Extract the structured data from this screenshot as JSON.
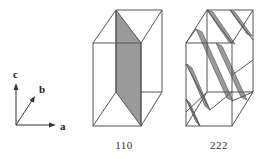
{
  "axes": {
    "a_label": "a",
    "b_label": "b",
    "c_label": "c"
  },
  "panels": [
    {
      "caption": "110",
      "description": "Unit cell with (110) plane shaded"
    },
    {
      "caption": "222",
      "description": "Unit cell with (222) planes shaded"
    }
  ],
  "colors": {
    "line": "#555555",
    "shade": "#9a9a9a"
  }
}
